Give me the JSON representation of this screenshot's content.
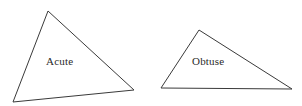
{
  "figure": {
    "width": 302,
    "height": 106,
    "background_color": "#ffffff",
    "stroke_color": "#3a3a3a",
    "stroke_width": 1,
    "text_color": "#2b2b2b"
  },
  "shapes": [
    {
      "name": "acute-triangle",
      "label": "Acute",
      "points": "48,11 134,90 13,102",
      "label_position": {
        "x": 46,
        "y": 56
      }
    },
    {
      "name": "obtuse-triangle",
      "label": "Obtuse",
      "points": "199,30 292,89 161,88",
      "label_position": {
        "x": 192,
        "y": 56
      }
    }
  ]
}
